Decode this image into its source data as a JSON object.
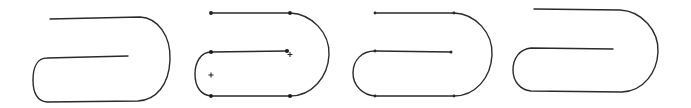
{
  "figure": {
    "panels": [
      {
        "id": "sketch",
        "label": "freehand-sketch"
      },
      {
        "id": "control-points",
        "label": "with-control-points-and-centers"
      },
      {
        "id": "fitted",
        "label": "fitted-points"
      },
      {
        "id": "final",
        "label": "final-curve"
      }
    ],
    "colors": {
      "stroke": "#2a2a2a",
      "background": "#ffffff"
    }
  }
}
